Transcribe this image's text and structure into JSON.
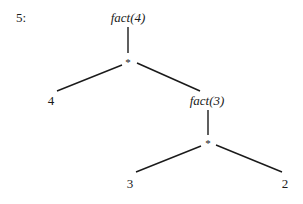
{
  "step_label": "5:",
  "tree": {
    "root": {
      "label": "fact(4)",
      "italic": true
    },
    "op1": {
      "label": "*"
    },
    "leaf_left": {
      "label": "4"
    },
    "sub": {
      "label": "fact(3)",
      "italic": true
    },
    "op2": {
      "label": "*"
    },
    "leaf_3": {
      "label": "3"
    },
    "leaf_2": {
      "label": "2"
    }
  },
  "colors": {
    "ink": "#1a1a1a",
    "background": "#ffffff"
  }
}
